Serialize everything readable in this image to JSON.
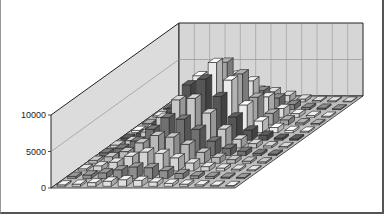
{
  "chart_data": {
    "type": "bar3d",
    "title": "",
    "xlabel": "",
    "ylabel": "",
    "zlabel": "",
    "ylim": [
      0,
      10000
    ],
    "y_ticks": [
      0,
      5000,
      10000
    ],
    "y_tick_labels": [
      "0",
      "5000",
      "10000"
    ],
    "grid": true,
    "legend": "none",
    "n_categories": 12,
    "n_series": 12,
    "series": [
      {
        "name": "s1",
        "shade": "#f2f2f2",
        "values": [
          200,
          300,
          500,
          700,
          900,
          800,
          600,
          400,
          300,
          200,
          150,
          100
        ]
      },
      {
        "name": "s2",
        "shade": "#9a9a9a",
        "values": [
          300,
          500,
          800,
          1200,
          1600,
          1500,
          1100,
          700,
          400,
          300,
          200,
          150
        ]
      },
      {
        "name": "s3",
        "shade": "#e6e6e6",
        "values": [
          300,
          700,
          1200,
          2000,
          2600,
          2400,
          1800,
          1100,
          600,
          400,
          250,
          150
        ]
      },
      {
        "name": "s4",
        "shade": "#c8c8c8",
        "values": [
          400,
          900,
          1600,
          2800,
          3800,
          3600,
          2600,
          1500,
          800,
          500,
          300,
          200
        ]
      },
      {
        "name": "s5",
        "shade": "#7a7a7a",
        "values": [
          400,
          1000,
          2000,
          3600,
          5200,
          5000,
          3600,
          2000,
          1000,
          600,
          300,
          200
        ]
      },
      {
        "name": "s6",
        "shade": "#d8d8d8",
        "values": [
          400,
          1000,
          2200,
          4200,
          6600,
          6800,
          4800,
          2600,
          1200,
          600,
          300,
          200
        ]
      },
      {
        "name": "s7",
        "shade": "#5e5e5e",
        "values": [
          300,
          900,
          2200,
          4400,
          7600,
          8400,
          6000,
          3200,
          1400,
          700,
          300,
          200
        ]
      },
      {
        "name": "s8",
        "shade": "#ffffff",
        "values": [
          300,
          800,
          2000,
          4200,
          7800,
          9600,
          7200,
          3800,
          1600,
          700,
          300,
          200
        ]
      },
      {
        "name": "s9",
        "shade": "#b0b0b0",
        "values": [
          200,
          600,
          1600,
          3400,
          6400,
          8600,
          7000,
          3800,
          1600,
          700,
          300,
          200
        ]
      },
      {
        "name": "s10",
        "shade": "#f0f0f0",
        "values": [
          200,
          400,
          1000,
          2200,
          4200,
          5800,
          5000,
          2800,
          1200,
          500,
          250,
          150
        ]
      },
      {
        "name": "s11",
        "shade": "#8c8c8c",
        "values": [
          150,
          300,
          600,
          1200,
          2200,
          3000,
          2600,
          1600,
          700,
          300,
          200,
          100
        ]
      },
      {
        "name": "s12",
        "shade": "#e0e0e0",
        "values": [
          100,
          200,
          400,
          700,
          1200,
          1600,
          1400,
          900,
          400,
          200,
          150,
          100
        ]
      }
    ],
    "colors": {
      "left_wall": "#dcdcdc",
      "back_wall": "#d6d6d6",
      "floor": "#bdbdbd",
      "grid_line": "#888888",
      "edge": "#222222"
    }
  }
}
